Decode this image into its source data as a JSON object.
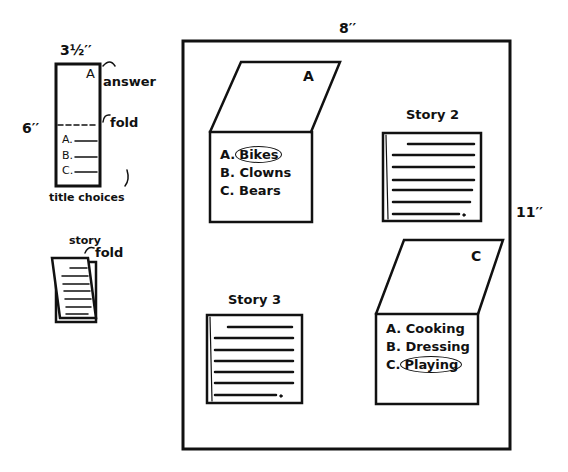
{
  "diagram": {
    "sheet": {
      "width_label": "8′′",
      "height_label": "11′′"
    },
    "template_card": {
      "width_label": "3½′′",
      "height_label": "6′′",
      "answer_letter": "A",
      "answer_label": "answer",
      "fold_label": "fold",
      "choices": [
        "A.",
        "B.",
        "C."
      ],
      "caption": "title choices"
    },
    "story_card": {
      "label": "story",
      "fold_label": "fold"
    },
    "cards": [
      {
        "type": "answer",
        "answer": "A",
        "choices": [
          {
            "prefix": "A.",
            "text": "Bikes",
            "circled": true
          },
          {
            "prefix": "B.",
            "text": "Clowns",
            "circled": false
          },
          {
            "prefix": "C.",
            "text": "Bears",
            "circled": false
          }
        ]
      },
      {
        "type": "story",
        "title": "Story 2"
      },
      {
        "type": "story",
        "title": "Story 3"
      },
      {
        "type": "answer",
        "answer": "C",
        "choices": [
          {
            "prefix": "A.",
            "text": "Cooking",
            "circled": false
          },
          {
            "prefix": "B.",
            "text": "Dressing",
            "circled": false
          },
          {
            "prefix": "C.",
            "text": "Playing",
            "circled": true
          }
        ]
      }
    ]
  }
}
